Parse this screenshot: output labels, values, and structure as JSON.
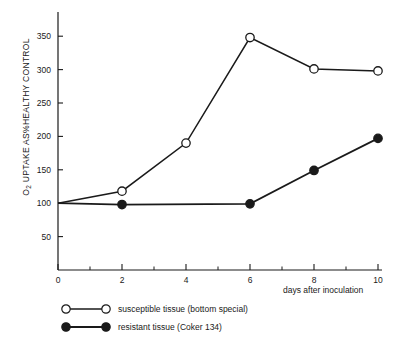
{
  "chart_data": {
    "type": "line",
    "title": "",
    "xlabel": "days after inoculation",
    "ylabel": "O2 UPTAKE AS%HEALTHY CONTROL",
    "ylabel_prefix": "O",
    "ylabel_sub": "2",
    "ylabel_rest": " UPTAKE AS%HEALTHY CONTROL",
    "xlim": [
      0,
      10
    ],
    "ylim": [
      0,
      380
    ],
    "grid": false,
    "legend_position": "below-axes-left",
    "x_ticks": [
      0,
      2,
      4,
      6,
      8,
      10
    ],
    "x_tick_labels": [
      "0",
      "2",
      "4",
      "6",
      "8",
      "10"
    ],
    "x_minor_ticks": [
      1,
      3,
      5,
      7,
      9
    ],
    "y_ticks": [
      50,
      100,
      150,
      200,
      250,
      300,
      350
    ],
    "y_tick_labels": [
      "50",
      "100",
      "150",
      "200",
      "250",
      "300",
      "350"
    ],
    "series": [
      {
        "name": "susceptible tissue (bottom special)",
        "marker": "open-circle",
        "color": "#1a1a1a",
        "x": [
          0,
          2,
          4,
          6,
          8,
          10
        ],
        "values": [
          100,
          118,
          190,
          348,
          301,
          298
        ],
        "marker_at_origin": false
      },
      {
        "name": "resistant tissue (Coker 134)",
        "marker": "filled-circle",
        "color": "#1a1a1a",
        "x": [
          0,
          2,
          6,
          8,
          10
        ],
        "values": [
          100,
          98,
          99,
          149,
          197
        ],
        "marker_at_origin": false
      }
    ]
  },
  "legend": {
    "items": [
      {
        "label": "susceptible tissue (bottom special)",
        "marker": "open-circle"
      },
      {
        "label": "resistant tissue (Coker 134)",
        "marker": "filled-circle"
      }
    ]
  },
  "axes": {
    "x_axis_label": "days after inoculation",
    "line_color": "#1a1a1a"
  }
}
